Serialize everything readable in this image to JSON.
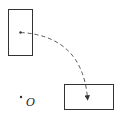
{
  "diagram": {
    "type": "rotation",
    "center": {
      "label": "O",
      "x": 21,
      "y": 97
    },
    "original_rect": {
      "x": 8,
      "y": 9,
      "w": 24,
      "h": 46,
      "point": {
        "x": 20,
        "y": 32
      }
    },
    "image_rect": {
      "x": 64,
      "y": 84,
      "w": 49,
      "h": 25,
      "point": {
        "x": 87,
        "y": 100
      }
    },
    "arc": {
      "style": "dashed",
      "arrow": "end"
    },
    "colors": {
      "stroke": "#333333",
      "background": "#ffffff"
    }
  }
}
